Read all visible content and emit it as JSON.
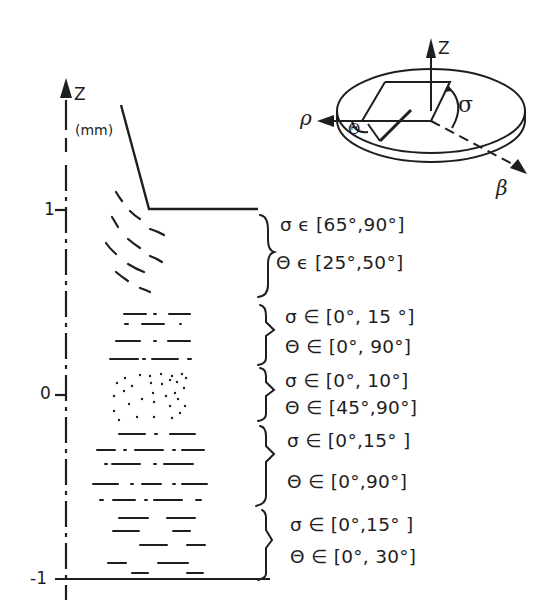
{
  "axis": {
    "label": "Z",
    "unit": "(mm)",
    "ticks": [
      {
        "label": "1",
        "y": 210
      },
      {
        "label": "0",
        "y": 395
      },
      {
        "label": "-1",
        "y": 579
      }
    ]
  },
  "inset": {
    "axes": {
      "z": "Z",
      "rho": "ρ",
      "beta": "β"
    },
    "angles": {
      "sigma": "σ",
      "theta": "Θ"
    }
  },
  "zones": [
    {
      "region": "curved-dashes",
      "sigma": "σ ϵ [65°,90°]",
      "theta": "Θ ϵ [25°,50°]"
    },
    {
      "region": "dash-dot",
      "sigma": "σ ∈ [0°, 15 °]",
      "theta": "Θ ∈ [0°, 90°]"
    },
    {
      "region": "dots",
      "sigma": "σ ∈ [0°, 10°]",
      "theta": "Θ ∈ [45°,90°]"
    },
    {
      "region": "dash-dot-dense",
      "sigma": "σ ∈ [0°,15° ]",
      "theta": "Θ ∈ [0°,90°]"
    },
    {
      "region": "dashes",
      "sigma": "σ ∈ [0°,15° ]",
      "theta": "Θ ∈ [0°, 30°]"
    }
  ],
  "colors": {
    "ink": "#1e1e1e",
    "background": "#ffffff"
  }
}
